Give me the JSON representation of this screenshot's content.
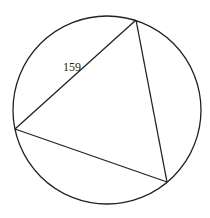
{
  "diagram": {
    "type": "inscribed-triangle",
    "circle": {
      "cx": 107,
      "cy": 110,
      "r": 94
    },
    "vertices": {
      "top": {
        "x": 136,
        "y": 20
      },
      "left": {
        "x": 15,
        "y": 129
      },
      "bottom_right": {
        "x": 167,
        "y": 182
      }
    },
    "labels": [
      {
        "text": "159",
        "side": "left-top",
        "x": 63,
        "y": 71
      }
    ],
    "stroke_color": "#222222"
  }
}
